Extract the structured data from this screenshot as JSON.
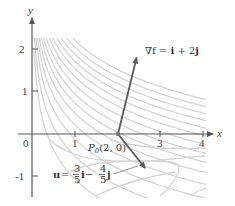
{
  "figure": {
    "function": "f(x, y) = x e^y",
    "x_axis_label": "x",
    "y_axis_label": "y",
    "x_ticks": [
      "0",
      "1",
      "3",
      "4"
    ],
    "y_ticks": [
      "2",
      "1",
      "-1"
    ],
    "x_range": [
      0,
      4.3
    ],
    "y_range": [
      -1.5,
      2.5
    ],
    "point": {
      "label": "P",
      "subscript": "0",
      "coords": "(2, 0)",
      "x": 2,
      "y": 0
    },
    "gradient_vector": {
      "label_prefix": "∇f = ",
      "i": "i",
      "plus": " + 2",
      "j": "j",
      "dx": 1,
      "dy": 2
    },
    "unit_vector": {
      "u": "u",
      "eq": " = ",
      "num1": "3",
      "den1": "5",
      "i": "i",
      "minus": " − ",
      "num2": "4",
      "den2": "5",
      "j": "j",
      "dx": 0.6,
      "dy": -0.8
    },
    "contour_levels": [
      0.35,
      0.6,
      0.9,
      1.25,
      1.65,
      2.1,
      2.6,
      3.2,
      3.9,
      4.7,
      5.6,
      6.6,
      7.8,
      9.2
    ],
    "colors": {
      "axis": "#555555",
      "contour": "#d4d4d4",
      "vector": "#5a5a5a"
    }
  }
}
